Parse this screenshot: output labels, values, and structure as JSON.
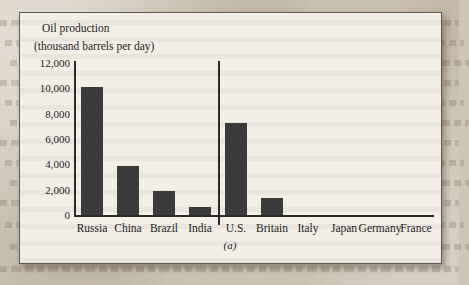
{
  "figure": {
    "title": "Oil production",
    "subtitle": "(thousand barrels per day)",
    "panel_label": "(a)"
  },
  "colors": {
    "bar": "#3a3a3a",
    "axis": "#2a2a2a",
    "figure_background": "#f3efe7",
    "figure_border": "#5e5a52",
    "page_background": "#cfc5b4",
    "text": "#1c1c1c"
  },
  "chart_data": {
    "type": "bar",
    "title": "Oil production",
    "subtitle": "(thousand barrels per day)",
    "xlabel": "",
    "ylabel": "thousand barrels per day",
    "categories": [
      "Russia",
      "China",
      "Brazil",
      "India",
      "U.S.",
      "Britain",
      "Italy",
      "Japan",
      "Germany",
      "France"
    ],
    "values": [
      10100,
      3900,
      1900,
      650,
      7250,
      1350,
      0,
      0,
      0,
      0
    ],
    "ylim": [
      0,
      12000
    ],
    "yticks": [
      0,
      2000,
      4000,
      6000,
      8000,
      10000,
      12000
    ],
    "ytick_labels": [
      "0",
      "2,000",
      "4,000",
      "6,000",
      "8,000",
      "10,000",
      "12,000"
    ],
    "grid": false,
    "legend": false,
    "annotations": [
      {
        "text": "(a)",
        "position": "below-axis-center"
      }
    ],
    "group_divider": {
      "after_category": "India",
      "left_group": [
        "Russia",
        "China",
        "Brazil",
        "India"
      ],
      "right_group": [
        "U.S.",
        "Britain",
        "Italy",
        "Japan",
        "Germany",
        "France"
      ]
    }
  }
}
